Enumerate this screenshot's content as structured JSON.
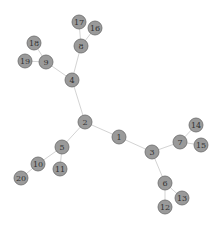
{
  "diagram": {
    "type": "tree-graph",
    "node_color": "#9a9a9a",
    "node_stroke": "#6a6a6a",
    "edge_color": "#c8c8c8",
    "node_radius": 7,
    "nodes": [
      {
        "id": "1",
        "x": 119,
        "y": 137
      },
      {
        "id": "2",
        "x": 85,
        "y": 122
      },
      {
        "id": "3",
        "x": 152,
        "y": 152
      },
      {
        "id": "4",
        "x": 72,
        "y": 80
      },
      {
        "id": "5",
        "x": 62,
        "y": 147
      },
      {
        "id": "6",
        "x": 165,
        "y": 183
      },
      {
        "id": "7",
        "x": 180,
        "y": 142
      },
      {
        "id": "8",
        "x": 81,
        "y": 46
      },
      {
        "id": "9",
        "x": 46,
        "y": 62
      },
      {
        "id": "10",
        "x": 38,
        "y": 164
      },
      {
        "id": "11",
        "x": 60,
        "y": 169
      },
      {
        "id": "12",
        "x": 165,
        "y": 207
      },
      {
        "id": "13",
        "x": 182,
        "y": 198
      },
      {
        "id": "14",
        "x": 196,
        "y": 125
      },
      {
        "id": "15",
        "x": 201,
        "y": 145
      },
      {
        "id": "16",
        "x": 95,
        "y": 28
      },
      {
        "id": "17",
        "x": 79,
        "y": 22
      },
      {
        "id": "18",
        "x": 34,
        "y": 43
      },
      {
        "id": "19",
        "x": 25,
        "y": 61
      },
      {
        "id": "20",
        "x": 21,
        "y": 178
      }
    ],
    "edges": [
      [
        "1",
        "2"
      ],
      [
        "1",
        "3"
      ],
      [
        "2",
        "4"
      ],
      [
        "2",
        "5"
      ],
      [
        "3",
        "6"
      ],
      [
        "3",
        "7"
      ],
      [
        "4",
        "8"
      ],
      [
        "4",
        "9"
      ],
      [
        "5",
        "10"
      ],
      [
        "5",
        "11"
      ],
      [
        "6",
        "12"
      ],
      [
        "6",
        "13"
      ],
      [
        "7",
        "14"
      ],
      [
        "7",
        "15"
      ],
      [
        "8",
        "16"
      ],
      [
        "8",
        "17"
      ],
      [
        "9",
        "18"
      ],
      [
        "9",
        "19"
      ],
      [
        "10",
        "20"
      ]
    ]
  }
}
